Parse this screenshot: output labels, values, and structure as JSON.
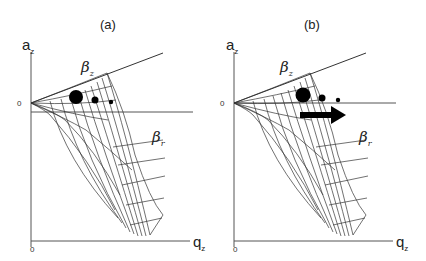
{
  "panels": [
    {
      "id": "a",
      "title": "(a)",
      "y_axis_label": "a",
      "y_axis_sub": "z",
      "x_axis_label": "q",
      "x_axis_sub": "z",
      "origin_y_tick": "0",
      "origin_x_tick": "0",
      "upper_region_label": "β",
      "upper_region_sub": "z",
      "lower_region_label": "β",
      "lower_region_sub": "r",
      "dots": [
        "large",
        "medium",
        "small"
      ],
      "arrow": false
    },
    {
      "id": "b",
      "title": "(b)",
      "y_axis_label": "a",
      "y_axis_sub": "z",
      "x_axis_label": "q",
      "x_axis_sub": "z",
      "origin_y_tick": "0",
      "origin_x_tick": "0",
      "upper_region_label": "β",
      "upper_region_sub": "z",
      "lower_region_label": "β",
      "lower_region_sub": "r",
      "dots": [
        "large",
        "medium",
        "small"
      ],
      "arrow": true,
      "arrow_direction": "right"
    }
  ],
  "colors": {
    "line": "#333333",
    "dot": "#000000",
    "background": "#ffffff"
  }
}
